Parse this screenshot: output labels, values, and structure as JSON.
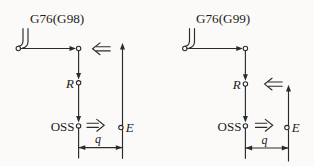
{
  "colors": {
    "background": "#fbfaf8",
    "line": "#2b2b2b",
    "text": "#1c1c1c"
  },
  "icons": {
    "boring_tool": "double-shank tool with open-circle tip",
    "double_arrow_left": "⇐",
    "double_arrow_right": "⇒"
  },
  "diagrams": [
    {
      "id": "g76-g98",
      "title": "G76(G98)",
      "labels": {
        "r_point": "R",
        "oss": "OSS",
        "e_point": "E",
        "shift_amount": "q"
      }
    },
    {
      "id": "g76-g99",
      "title": "G76(G99)",
      "labels": {
        "r_point": "R",
        "oss": "OSS",
        "e_point": "E",
        "shift_amount": "q"
      }
    }
  ]
}
